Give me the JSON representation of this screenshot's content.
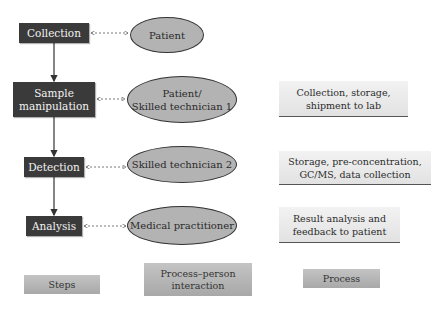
{
  "steps": [
    {
      "label": "Collection"
    },
    {
      "label": "Sample\nmanipulation"
    },
    {
      "label": "Detection"
    },
    {
      "label": "Analysis"
    }
  ],
  "persons": [
    {
      "label": "Patient"
    },
    {
      "label": "Patient/\nSkilled technician 1"
    },
    {
      "label": "Skilled technician 2"
    },
    {
      "label": "Medical practitioner"
    }
  ],
  "processes": [
    {
      "label": "Collection, storage,\nshipment to lab"
    },
    {
      "label": "Storage, pre-concentration,\nGC/MS, data collection"
    },
    {
      "label": "Result analysis and\nfeedback to patient"
    }
  ],
  "legend": {
    "steps": "Steps",
    "interaction": "Process–person\ninteraction",
    "process": "Process"
  },
  "colors": {
    "step_fill": "#3a3a3a",
    "person_fill": "#b3b3b3",
    "process_fill": "#eaeaea",
    "legend_fill": "#b6b6b6"
  }
}
